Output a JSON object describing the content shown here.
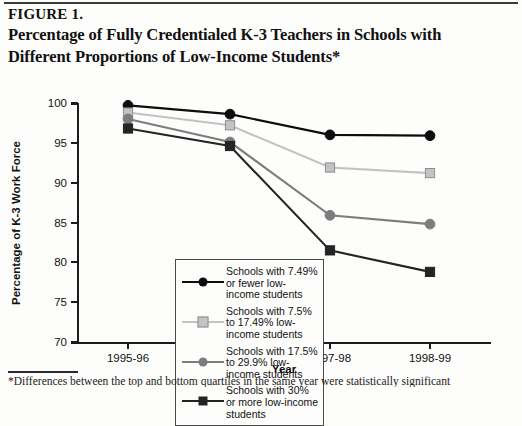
{
  "figure": {
    "label": "FIGURE 1.",
    "title": "Percentage of Fully Credentialed K-3 Teachers in Schools with Different Proportions of Low-Income Students*",
    "footnote": "*Differences between the top and bottom quartiles in the same year were statistically significant"
  },
  "chart_data": {
    "type": "line",
    "title": "Percentage of Fully Credentialed K-3 Teachers in Schools with Different Proportions of Low-Income Students*",
    "xlabel": "Year",
    "ylabel": "Percentage of K-3 Work Force",
    "categories": [
      "1995-96",
      "1996-97",
      "1997-98",
      "1998-99"
    ],
    "ylim": [
      70,
      100
    ],
    "yticks": [
      70,
      75,
      80,
      85,
      90,
      95,
      100
    ],
    "grid": false,
    "legend_position": "inside-lower-left",
    "series": [
      {
        "name": "Schools with 7.49% or fewer low-income students",
        "values": [
          99.7,
          98.6,
          96.0,
          95.9
        ],
        "color": "#0d0d0d",
        "marker": "circle"
      },
      {
        "name": "Schools with 7.5% to 17.49% low-income students",
        "values": [
          98.8,
          97.2,
          91.9,
          91.2
        ],
        "color": "#c3c3c3",
        "marker": "square"
      },
      {
        "name": "Schools with 17.5% to 29.9% low-income students",
        "values": [
          98.0,
          95.1,
          85.9,
          84.8
        ],
        "color": "#7d7d7d",
        "marker": "circle"
      },
      {
        "name": "Schools with 30% or more low-income students",
        "values": [
          96.8,
          94.6,
          81.5,
          78.8
        ],
        "color": "#242424",
        "marker": "square"
      }
    ]
  },
  "legend": {
    "items": [
      {
        "label": "Schools with 7.49% or fewer low-income students",
        "color": "#0d0d0d",
        "marker": "circle"
      },
      {
        "label": "Schools with 7.5% to 17.49% low-income students",
        "color": "#c3c3c3",
        "marker": "square"
      },
      {
        "label": "Schools with 17.5% to 29.9% low-income students",
        "color": "#7d7d7d",
        "marker": "circle"
      },
      {
        "label": "Schools with 30% or more low-income students",
        "color": "#242424",
        "marker": "square"
      }
    ]
  }
}
